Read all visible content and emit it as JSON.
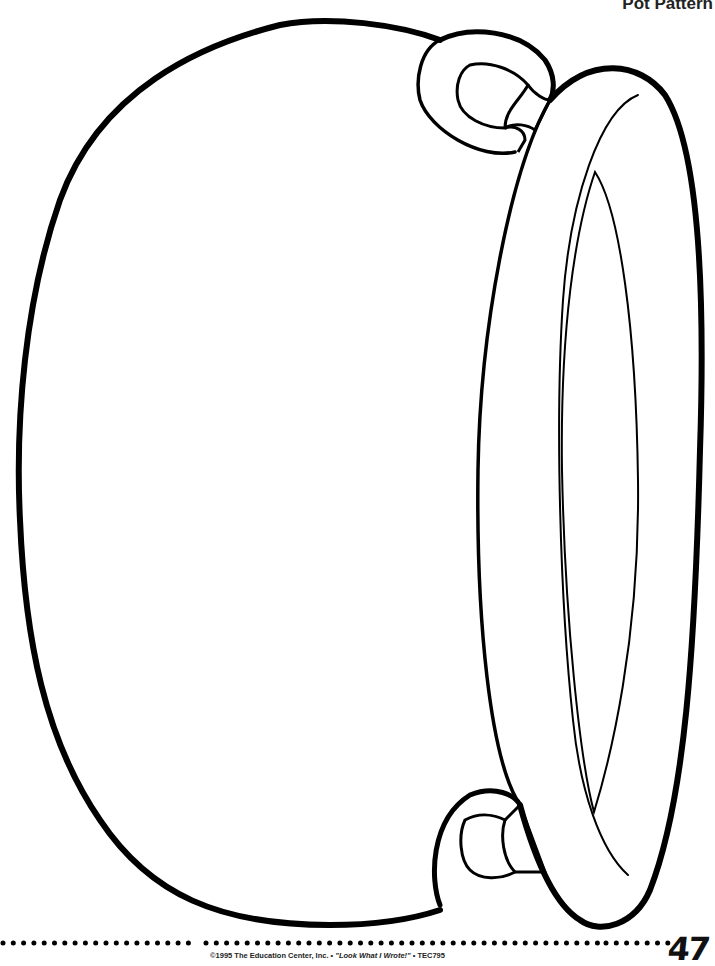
{
  "header": {
    "title": "Pot Pattern"
  },
  "illustration": {
    "subject": "cauldron-pot-outline",
    "stroke_color": "#000000",
    "fill_color": "#ffffff"
  },
  "footer": {
    "copyright": "©1995 The Education Center, Inc. • ",
    "book_title": "\"Look What I Wrote!\"",
    "code": " • TEC795",
    "page_number": "47"
  }
}
